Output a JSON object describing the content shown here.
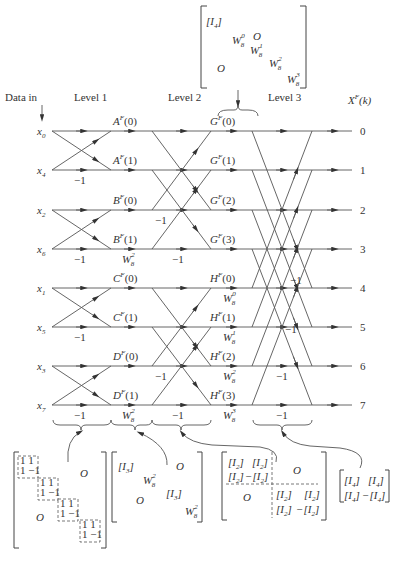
{
  "header": {
    "data_in": "Data in",
    "levels": [
      "Level 1",
      "Level 2",
      "Level 3"
    ],
    "output_label": "X",
    "output_sup": "F",
    "output_arg": "(k)"
  },
  "inputs": [
    "x0",
    "x4",
    "x2",
    "x6",
    "x1",
    "x5",
    "x3",
    "x7"
  ],
  "input_subs": [
    "0",
    "4",
    "2",
    "6",
    "1",
    "5",
    "3",
    "7"
  ],
  "outputs": [
    "0",
    "1",
    "2",
    "3",
    "4",
    "5",
    "6",
    "7"
  ],
  "level1_nodes": [
    {
      "letter": "A",
      "arg": "(0)"
    },
    {
      "letter": "A",
      "arg": "(1)"
    },
    {
      "letter": "B",
      "arg": "(0)"
    },
    {
      "letter": "B",
      "arg": "(1)"
    },
    {
      "letter": "C",
      "arg": "(0)"
    },
    {
      "letter": "C",
      "arg": "(1)"
    },
    {
      "letter": "D",
      "arg": "(0)"
    },
    {
      "letter": "D",
      "arg": "(1)"
    }
  ],
  "level2_nodes": [
    {
      "letter": "G",
      "arg": "(0)"
    },
    {
      "letter": "G",
      "arg": "(1)"
    },
    {
      "letter": "G",
      "arg": "(2)"
    },
    {
      "letter": "G",
      "arg": "(3)"
    },
    {
      "letter": "H",
      "arg": "(0)"
    },
    {
      "letter": "H",
      "arg": "(1)"
    },
    {
      "letter": "H",
      "arg": "(2)"
    },
    {
      "letter": "H",
      "arg": "(3)"
    }
  ],
  "weights": {
    "minus_one": "−1",
    "W": "W",
    "sub8": "8",
    "level1_twiddle_sup": "2",
    "level2_twiddle_sups": [
      "0",
      "1",
      "2",
      "3"
    ]
  },
  "matrices": {
    "top": {
      "identity": "[I",
      "identity_sub": "4",
      "zero": "O",
      "diag_sups": [
        "0",
        "1",
        "2",
        "3"
      ]
    },
    "bottom1": {
      "one": "1",
      "neg_one": "1 −1",
      "zero": "O"
    },
    "bottom2": {
      "identity": "[I",
      "identity_sub": "3",
      "zero": "O",
      "twiddle_sup": "2"
    },
    "bottom3": {
      "identity": "[I",
      "identity_sub": "2",
      "neg": "−",
      "zero": "O"
    },
    "bottom4": {
      "identity": "[I",
      "identity_sub": "4",
      "neg": "−"
    }
  },
  "colors": {
    "line": "#555555",
    "text": "#333333",
    "background": "#ffffff"
  }
}
